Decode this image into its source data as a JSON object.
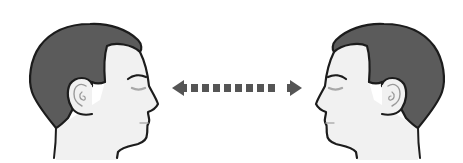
{
  "figure": {
    "left_head": {
      "facing": "right"
    },
    "right_head": {
      "facing": "left"
    },
    "arrow": {
      "style": "dashed",
      "direction": "bidirectional",
      "dash_count": 8
    },
    "colors": {
      "hair": "#5b5b5b",
      "skin": "#f1f1f1",
      "outline": "#1c1c1c",
      "arrow": "#555555",
      "background": "#ffffff",
      "ear_inner": "#9a9a9a",
      "eye_shadow": "#a8a8a8"
    }
  }
}
